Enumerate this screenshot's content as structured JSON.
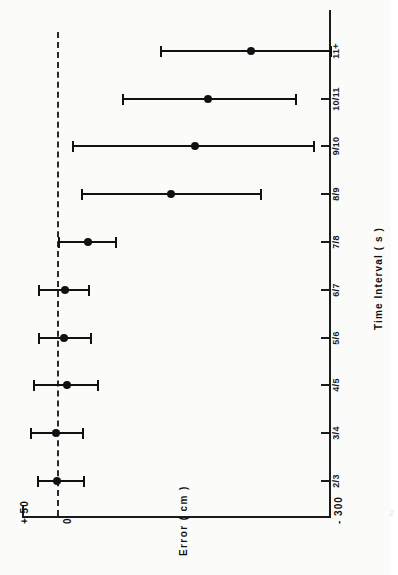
{
  "figure": {
    "background_color": "#fbfbfa",
    "ink_color": "#111111",
    "orientation": "rotated-90-ccw"
  },
  "chart_data": {
    "type": "scatter",
    "title": "",
    "subtitle": "",
    "xlabel": "Time Interval  ( s )",
    "ylabel": "Error  ( cm )",
    "categories": [
      "2/3",
      "3/4",
      "4/5",
      "5/6",
      "6/7",
      "7/8",
      "8/9",
      "9/10",
      "10/11",
      "11+"
    ],
    "tick_labels": [
      "2/3",
      "3/4",
      "4/5",
      "5/6",
      "6/7",
      "7/8",
      "8/9",
      "9/10",
      "10/11",
      "11+"
    ],
    "y_tick_labels": [
      "+ 50",
      "0",
      "- 300"
    ],
    "y_tick_values": [
      50,
      0,
      -300
    ],
    "ylim": [
      -300,
      50
    ],
    "grid": false,
    "legend": null,
    "zero_reference_line": {
      "value": 0,
      "style": "dashed"
    },
    "series": [
      {
        "name": "Mean error with error bars",
        "marker": "filled-circle",
        "values": [
          2,
          3,
          -9,
          -6,
          -7,
          -32,
          -124,
          -150,
          -164,
          -212
        ],
        "error_low": [
          -28,
          -26,
          -43,
          -35,
          -33,
          -63,
          -223,
          -281,
          -261,
          -300
        ],
        "error_high": [
          23,
          31,
          28,
          22,
          22,
          0,
          -25,
          -15,
          -71,
          -113
        ]
      }
    ],
    "points": [
      {
        "category": "2/3",
        "mean": 2,
        "low": -28,
        "high": 23
      },
      {
        "category": "3/4",
        "mean": 3,
        "low": -26,
        "high": 31
      },
      {
        "category": "4/5",
        "mean": -9,
        "low": -43,
        "high": 28
      },
      {
        "category": "5/6",
        "mean": -6,
        "low": -35,
        "high": 22
      },
      {
        "category": "6/7",
        "mean": -7,
        "low": -33,
        "high": 22
      },
      {
        "category": "7/8",
        "mean": -32,
        "low": -63,
        "high": 0
      },
      {
        "category": "8/9",
        "mean": -124,
        "low": -223,
        "high": -25
      },
      {
        "category": "9/10",
        "mean": -150,
        "low": -281,
        "high": -15
      },
      {
        "category": "10/11",
        "mean": -164,
        "low": -261,
        "high": -71
      },
      {
        "category": "11+",
        "mean": -212,
        "low": -300,
        "high": -113
      }
    ]
  },
  "caption_bleed": "Fig."
}
